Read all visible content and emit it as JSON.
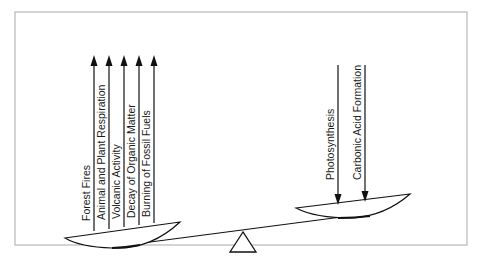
{
  "colors": {
    "frame": "#bdbdbd",
    "ink": "#111111",
    "background": "#ffffff"
  },
  "left_side": {
    "direction": "up",
    "meaning": "carbon sources (release to atmosphere)",
    "labels": [
      "Forest Fires",
      "Animal and Plant Respiration",
      "Volcanic Activity",
      "Decay of Organic Matter",
      "Burning of Fossil Fuels"
    ]
  },
  "right_side": {
    "direction": "down",
    "meaning": "carbon sinks (removal from atmosphere)",
    "labels": [
      "Photosynthesis",
      "Carbonic Acid Formation"
    ]
  },
  "scale": {
    "tilt": "left side lower",
    "fulcrum_icon": "triangle-icon"
  }
}
